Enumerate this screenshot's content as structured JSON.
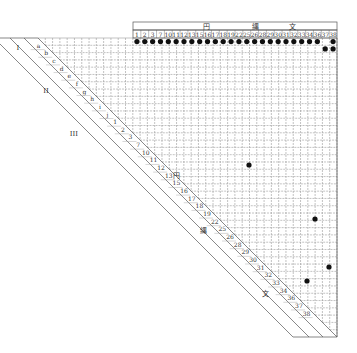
{
  "header": {
    "group_labels": [
      {
        "text": "円",
        "x": 206
      },
      {
        "text": "縄",
        "x": 255
      },
      {
        "text": "文",
        "x": 292
      }
    ],
    "columns": [
      "1",
      "2",
      "3",
      "7",
      "10",
      "11",
      "12",
      "13",
      "15",
      "16",
      "17",
      "18",
      "19",
      "22",
      "25",
      "26",
      "28",
      "29",
      "30",
      "31",
      "32",
      "33",
      "34",
      "36",
      "37",
      "38"
    ]
  },
  "left_bands": {
    "roman": [
      "I",
      "II",
      "III"
    ],
    "letters": [
      "a",
      "b",
      "c",
      "d",
      "e",
      "f",
      "g",
      "h",
      "i",
      "j"
    ],
    "numbers": [
      "1",
      "2",
      "3",
      "7",
      "10",
      "11",
      "12",
      "13",
      "15",
      "16",
      "17",
      "18",
      "19",
      "22",
      "25",
      "26",
      "28",
      "29",
      "30",
      "31",
      "32",
      "33",
      "34",
      "36",
      "37",
      "38"
    ],
    "group_labels": [
      "円",
      "縄",
      "文"
    ]
  },
  "dots_row0_missing_col": "37",
  "dots_row1_cols": [
    "37",
    "38"
  ],
  "extra_dots": [
    {
      "x": 249,
      "y": 165
    },
    {
      "x": 315,
      "y": 219
    },
    {
      "x": 329,
      "y": 267
    },
    {
      "x": 307,
      "y": 281
    }
  ],
  "colors": {
    "grid": "#9a9a9a",
    "line": "#555555",
    "dot": "#111111"
  }
}
